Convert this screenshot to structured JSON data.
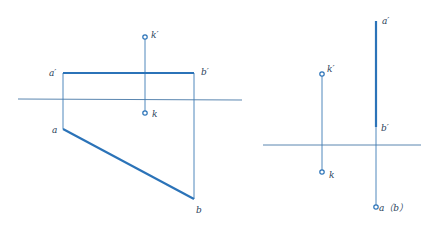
{
  "colors": {
    "thick_line": "#2b73b8",
    "thin_line": "#3d7bb4",
    "axis_line": "#5a86b0",
    "label": "#2a3f5a"
  },
  "left_figure": {
    "labels": {
      "a_prime": "a′",
      "b_prime": "b′",
      "k_prime": "k′",
      "k": "k",
      "a": "a",
      "b": "b"
    }
  },
  "right_figure": {
    "labels": {
      "a_prime": "a′",
      "b_prime": "b′",
      "k_prime": "k′",
      "k": "k",
      "ab": "a（b）"
    }
  }
}
